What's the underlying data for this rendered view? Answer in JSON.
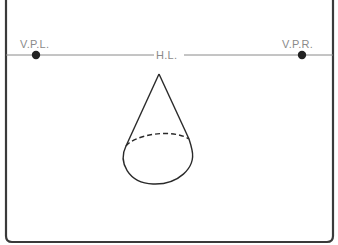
{
  "diagram": {
    "type": "two-point perspective reference",
    "labels": {
      "vanishing_point_left": "V.P.L.",
      "vanishing_point_right": "V.P.R.",
      "horizon_line": "H.L."
    },
    "colors": {
      "frame": "#3a3a3a",
      "horizon_line": "#8a8a8a",
      "label_text": "#8a8a8a",
      "vanishing_points": "#222222",
      "cone_stroke": "#2a2a2a"
    },
    "shapes": {
      "cone": {
        "apex": [
          159,
          74
        ],
        "base_center": [
          158,
          164
        ],
        "base_rx": 36,
        "base_ry": 34,
        "hidden_edge_style": "dashed"
      }
    }
  }
}
